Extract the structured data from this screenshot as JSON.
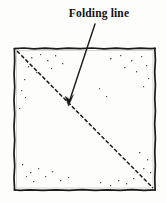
{
  "figure": {
    "type": "line-drawing",
    "background_color": "#fdfdfc",
    "ink_color": "#1a1a1a"
  },
  "callout": {
    "label": "Folding line",
    "leader_line": {
      "from_x": 95,
      "from_y": 24,
      "to_x": 69,
      "to_y": 104
    },
    "arrowhead": {
      "tip_x": 69,
      "tip_y": 105,
      "points_at": "folding-line"
    }
  },
  "paper": {
    "shape": "square",
    "left": 14,
    "top": 48,
    "right": 155,
    "bottom": 190,
    "width": 141,
    "height": 142,
    "border_style": "rough-hand-drawn",
    "border_color": "#1a1a1a"
  },
  "folding_line": {
    "style": "dashed",
    "from_corner": "top-left",
    "to_corner": "bottom-right",
    "x1": 17,
    "y1": 51,
    "x2": 153,
    "y2": 188,
    "dash_pattern": "4 2",
    "color": "#1a1a1a"
  },
  "speckles": [
    {
      "x": 31,
      "y": 57
    },
    {
      "x": 40,
      "y": 54
    },
    {
      "x": 47,
      "y": 60
    },
    {
      "x": 55,
      "y": 55
    },
    {
      "x": 62,
      "y": 63
    },
    {
      "x": 51,
      "y": 68
    },
    {
      "x": 36,
      "y": 72
    },
    {
      "x": 28,
      "y": 66
    },
    {
      "x": 24,
      "y": 79
    },
    {
      "x": 21,
      "y": 90
    },
    {
      "x": 25,
      "y": 97
    },
    {
      "x": 19,
      "y": 108
    },
    {
      "x": 110,
      "y": 58
    },
    {
      "x": 120,
      "y": 55
    },
    {
      "x": 131,
      "y": 60
    },
    {
      "x": 141,
      "y": 56
    },
    {
      "x": 124,
      "y": 67
    },
    {
      "x": 136,
      "y": 71
    },
    {
      "x": 146,
      "y": 65
    },
    {
      "x": 148,
      "y": 78
    },
    {
      "x": 143,
      "y": 86
    },
    {
      "x": 106,
      "y": 96
    },
    {
      "x": 99,
      "y": 88
    },
    {
      "x": 22,
      "y": 164
    },
    {
      "x": 30,
      "y": 172
    },
    {
      "x": 38,
      "y": 168
    },
    {
      "x": 45,
      "y": 176
    },
    {
      "x": 52,
      "y": 171
    },
    {
      "x": 33,
      "y": 181
    },
    {
      "x": 26,
      "y": 176
    },
    {
      "x": 60,
      "y": 180
    },
    {
      "x": 68,
      "y": 177
    },
    {
      "x": 139,
      "y": 152
    },
    {
      "x": 147,
      "y": 159
    },
    {
      "x": 143,
      "y": 168
    },
    {
      "x": 150,
      "y": 172
    },
    {
      "x": 133,
      "y": 178
    },
    {
      "x": 126,
      "y": 183
    },
    {
      "x": 118,
      "y": 180
    },
    {
      "x": 110,
      "y": 185
    },
    {
      "x": 100,
      "y": 182
    }
  ]
}
